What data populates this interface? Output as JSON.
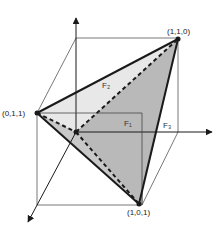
{
  "diagram": {
    "vertices": {
      "v110": "(1,1,0)",
      "v011": "(0,1,1)",
      "v101": "(1,0,1)"
    },
    "faces": {
      "f1": "F₁",
      "f2": "F₂",
      "f3": "F₃"
    },
    "colors": {
      "edge": "#1a1a1a",
      "cube_line": "#555555",
      "face_light": "#e6e6e6",
      "face_mid": "#bdbdbd",
      "face_dark": "#a8a8a8",
      "background": "#ffffff"
    }
  }
}
